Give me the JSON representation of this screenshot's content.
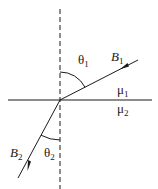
{
  "diagram": {
    "colors": {
      "line": "#1a1a1a",
      "background": "#ffffff"
    },
    "labels": {
      "theta1": "θ",
      "theta1_sub": "1",
      "theta2": "θ",
      "theta2_sub": "2",
      "B1": "B",
      "B1_sub": "1",
      "B2": "B",
      "B2_sub": "2",
      "mu1": "μ",
      "mu1_sub": "1",
      "mu2": "μ",
      "mu2_sub": "2"
    },
    "elements": {
      "normal": "vertical dashed normal line",
      "boundary": "horizontal interface line",
      "field_line_1": "B1 incident field line in medium 1",
      "field_line_2": "B2 refracted field line in medium 2"
    }
  }
}
